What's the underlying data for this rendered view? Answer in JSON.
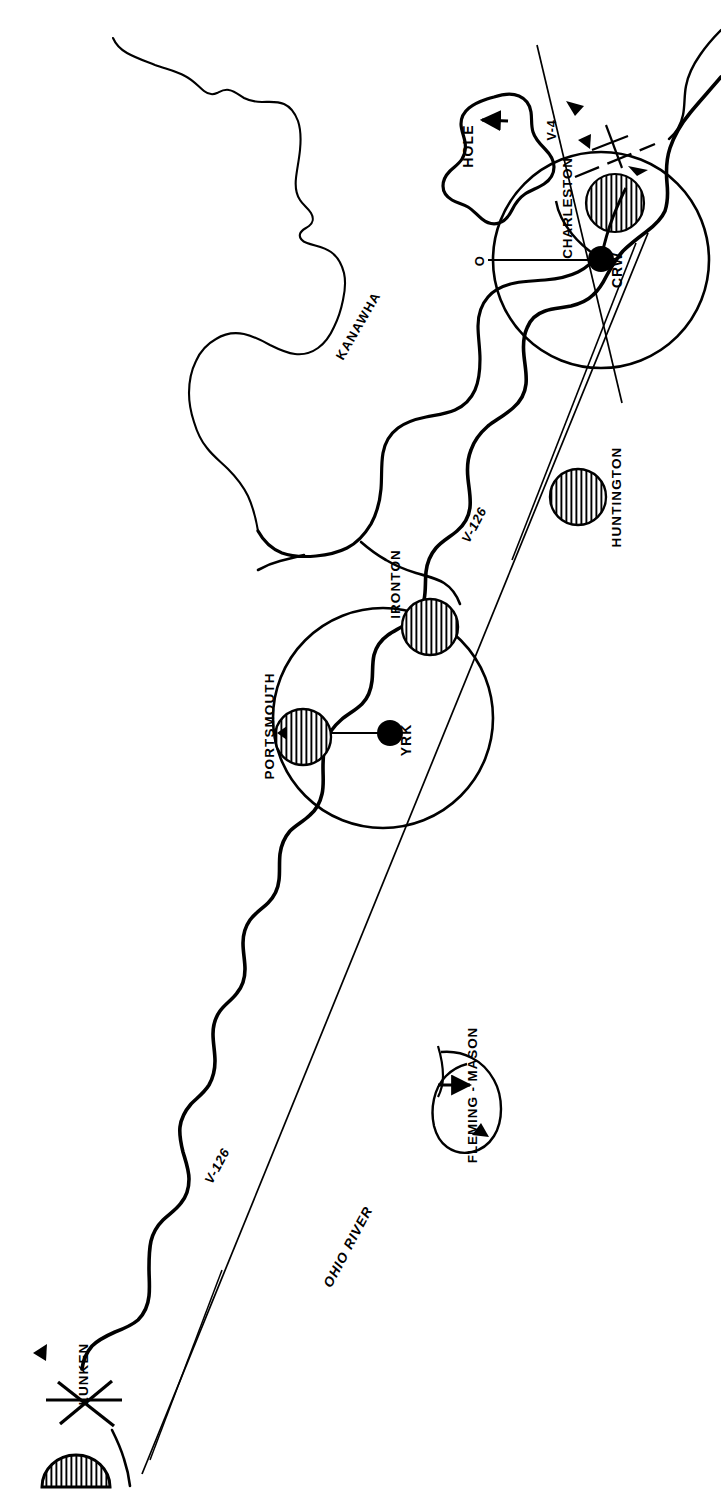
{
  "map": {
    "title": "Ohio River Valley VOR Airway Route Map",
    "orientation": "rotated-90",
    "background_color": "#ffffff",
    "ink_color": "#000000"
  },
  "labels": {
    "hole": "HOLE",
    "charleston": "CHARLESTON",
    "crw": "CRW",
    "radial_origin": "O",
    "victor_4": "V-4",
    "kanawha": "KANAWHA",
    "huntington": "HUNTINGTON",
    "ironton": "IRONTON",
    "victor_126_upper": "V-126",
    "portsmouth": "PORTSMOUTH",
    "yrk": "YRK",
    "fleming_mason": "FLEMING - MASON",
    "ohio_river": "OHIO RIVER",
    "victor_126_lower": "V-126",
    "lunken": "LUNKEN"
  },
  "navaids": [
    {
      "id": "CRW",
      "name": "CRW",
      "city": "CHARLESTON",
      "x": 600,
      "y": 259,
      "ring_cx": 601,
      "ring_cy": 260,
      "ring_r": 108
    },
    {
      "id": "YRK",
      "name": "YRK",
      "city": "PORTSMOUTH",
      "x": 390,
      "y": 733,
      "ring_cx": 383,
      "ring_cy": 718,
      "ring_r": 110
    }
  ],
  "cities": [
    {
      "name": "CHARLESTON",
      "cx": 615,
      "cy": 203,
      "r": 29
    },
    {
      "name": "HUNTINGTON",
      "cx": 578,
      "cy": 497,
      "r": 28
    },
    {
      "name": "IRONTON",
      "cx": 430,
      "cy": 627,
      "r": 28
    },
    {
      "name": "PORTSMOUTH",
      "cx": 303,
      "cy": 737,
      "r": 28
    },
    {
      "name": "LUNKEN",
      "cx": 75,
      "cy": 1458,
      "r": 30
    }
  ],
  "airways": [
    {
      "designator": "V-126",
      "label_positions": [
        {
          "x": 478,
          "y": 527
        },
        {
          "x": 221,
          "y": 1168
        }
      ]
    },
    {
      "designator": "V-4",
      "label_positions": [
        {
          "x": 556,
          "y": 130
        }
      ]
    }
  ],
  "rivers": [
    {
      "name": "KANAWHA",
      "label_x": 362,
      "label_y": 328
    },
    {
      "name": "OHIO RIVER",
      "label_x": 352,
      "label_y": 1249
    }
  ],
  "markers": [
    {
      "name": "HOLE",
      "type": "arrow-to-area",
      "x": 473,
      "y": 146
    },
    {
      "name": "FLEMING - MASON",
      "type": "arrow-to-area",
      "x": 478,
      "y": 1095
    },
    {
      "name": "LUNKEN",
      "type": "airport-cross",
      "x": 88,
      "y": 1404
    }
  ]
}
